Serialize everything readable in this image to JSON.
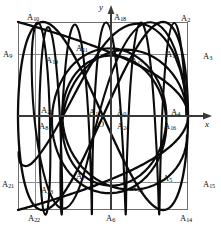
{
  "figure": {
    "type": "lissajous-curve-diagram",
    "title": "",
    "background_color": "#ffffff",
    "curve_color": "#0b0b0b",
    "grid_color": "#8c8c8c",
    "frame_color": "#6f6f6f",
    "axis_color": "#3a3a3a",
    "frame": {
      "x0": 18,
      "y0": 22,
      "x1": 188,
      "y1": 210
    },
    "grid": {
      "vertical_x": [
        35,
        111,
        187
      ],
      "horizontal_y": [
        54,
        116,
        182
      ],
      "visible": true
    }
  },
  "axes": {
    "x_label": "x",
    "y_label": "y",
    "origin_label": "O",
    "x_axis": {
      "y": 116,
      "from_x": 18,
      "to_x": 212,
      "arrow": true
    },
    "y_axis": {
      "x": 111,
      "from_y": 210,
      "to_y": 5,
      "arrow": true
    }
  },
  "chart_data": {
    "type": "line",
    "curves": [
      {
        "name": "curve-1",
        "x_freq": 1,
        "y_freq": 2
      },
      {
        "name": "curve-2",
        "x_freq": 2,
        "y_freq": 1
      }
    ]
  },
  "points": [
    {
      "id": "A0",
      "label": "A",
      "sub": "0",
      "x": 117,
      "y": 108
    },
    {
      "id": "A1",
      "label": "A",
      "sub": "1",
      "x": 166,
      "y": 50
    },
    {
      "id": "A2",
      "label": "A",
      "sub": "2",
      "x": 181,
      "y": 14
    },
    {
      "id": "A3",
      "label": "A",
      "sub": "3",
      "x": 203,
      "y": 52
    },
    {
      "id": "A4",
      "label": "A",
      "sub": "4",
      "x": 171,
      "y": 108
    },
    {
      "id": "A5",
      "label": "A",
      "sub": "5",
      "x": 163,
      "y": 174
    },
    {
      "id": "A6",
      "label": "A",
      "sub": "6",
      "x": 106,
      "y": 214
    },
    {
      "id": "A7",
      "label": "A",
      "sub": "7",
      "x": 76,
      "y": 172
    },
    {
      "id": "A8",
      "label": "A",
      "sub": "8",
      "x": 39,
      "y": 122
    },
    {
      "id": "A9",
      "label": "A",
      "sub": "9",
      "x": 3,
      "y": 50
    },
    {
      "id": "A10",
      "label": "A",
      "sub": "10",
      "x": 27,
      "y": 13
    },
    {
      "id": "A11",
      "label": "A",
      "sub": "11",
      "x": 76,
      "y": 44
    },
    {
      "id": "A12",
      "label": "A",
      "sub": "12",
      "x": 89,
      "y": 108
    },
    {
      "id": "A13",
      "label": "A",
      "sub": "13",
      "x": 131,
      "y": 184
    },
    {
      "id": "A14",
      "label": "A",
      "sub": "14",
      "x": 180,
      "y": 214
    },
    {
      "id": "A15",
      "label": "A",
      "sub": "15",
      "x": 203,
      "y": 180
    },
    {
      "id": "A16",
      "label": "A",
      "sub": "16",
      "x": 164,
      "y": 122
    },
    {
      "id": "A17",
      "label": "A",
      "sub": "17",
      "x": 131,
      "y": 57
    },
    {
      "id": "A18",
      "label": "A",
      "sub": "18",
      "x": 114,
      "y": 13
    },
    {
      "id": "A19",
      "label": "A",
      "sub": "19",
      "x": 46,
      "y": 56
    },
    {
      "id": "A20",
      "label": "A",
      "sub": "20",
      "x": 41,
      "y": 106
    },
    {
      "id": "A21",
      "label": "A",
      "sub": "21",
      "x": 2,
      "y": 180
    },
    {
      "id": "A22",
      "label": "A",
      "sub": "22",
      "x": 28,
      "y": 214
    },
    {
      "id": "A23",
      "label": "A",
      "sub": "23",
      "x": 41,
      "y": 186
    },
    {
      "id": "A24",
      "label": "A",
      "sub": "24",
      "x": 117,
      "y": 122
    }
  ]
}
